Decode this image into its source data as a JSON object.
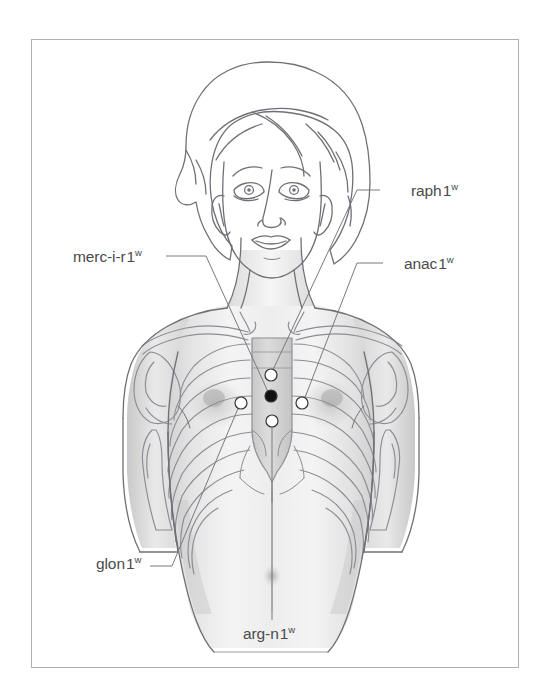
{
  "figure": {
    "kind": "anatomical-point-diagram",
    "view": "anterior",
    "width": 539,
    "height": 695,
    "border": {
      "x": 31,
      "y": 39,
      "width": 487,
      "height": 628,
      "color": "#b0b0b0"
    },
    "colors": {
      "background": "#ffffff",
      "outline": "#6f6f76",
      "bone_outline": "#8a8a92",
      "skin_shade_light": "#ececec",
      "skin_shade_mid": "#d8d8d8",
      "skin_shade_dark": "#bcbcbc",
      "label_text": "#4a4a4a",
      "leader_line": "#7a7a7a",
      "marker_fill_open": "#ffffff",
      "marker_fill_filled": "#111111",
      "marker_stroke": "#333333"
    }
  },
  "labels": [
    {
      "id": "raph",
      "name": "raph",
      "index": "1",
      "superscript": "w",
      "text": "raph 1",
      "full_text": "raph 1w",
      "side": "right",
      "text_x": 411,
      "text_y": 183,
      "marker_id": "raph-point",
      "leader": "M 380 190 L 420 190",
      "leader_path": "M 380 190 L 357 190 L 272 372"
    },
    {
      "id": "anac",
      "name": "anac",
      "index": "1",
      "superscript": "w",
      "text": "anac 1",
      "full_text": "anac 1w",
      "side": "right",
      "text_x": 404,
      "text_y": 256,
      "marker_id": "anac-point",
      "leader_path": "M 383 263 L 357 263 L 304 400"
    },
    {
      "id": "merc-i-r",
      "name": "merc-i-r",
      "index": "1",
      "superscript": "w",
      "text": "merc-i-r 1",
      "full_text": "merc-i-r 1w",
      "side": "left",
      "text_x": 73,
      "text_y": 249,
      "marker_id": "merc-point",
      "leader_path": "M 166 256 L 206 256 L 269 394"
    },
    {
      "id": "glon",
      "name": "glon",
      "index": "1",
      "superscript": "w",
      "text": "glon 1",
      "full_text": "glon 1w",
      "side": "left-lower",
      "text_x": 96,
      "text_y": 556,
      "marker_id": "glon-point",
      "leader_path": "M 150 566 L 172 566 L 239 406"
    },
    {
      "id": "arg-n",
      "name": "arg-n",
      "index": "1",
      "superscript": "w",
      "text": "arg-n 1",
      "full_text": "arg-n 1w",
      "side": "bottom-center",
      "text_x": 243,
      "text_y": 626,
      "marker_id": "argn-point",
      "leader_path": "M 272 424 L 272 620"
    }
  ],
  "markers": [
    {
      "id": "raph-point",
      "label": "raph 1",
      "cx": 271,
      "cy": 375,
      "r": 6.0,
      "style": "open"
    },
    {
      "id": "merc-point",
      "label": "merc-i-r 1",
      "cx": 271,
      "cy": 396,
      "r": 6.0,
      "style": "filled"
    },
    {
      "id": "glon-point",
      "label": "glon 1",
      "cx": 241,
      "cy": 403,
      "r": 6.0,
      "style": "open"
    },
    {
      "id": "anac-point",
      "label": "anac 1",
      "cx": 302,
      "cy": 403,
      "r": 6.0,
      "style": "open"
    },
    {
      "id": "argn-point",
      "label": "arg-n 1",
      "cx": 272,
      "cy": 421,
      "r": 6.0,
      "style": "open"
    }
  ],
  "anatomy": {
    "regions": [
      "head",
      "face",
      "hair",
      "neck",
      "shoulders",
      "clavicle-left",
      "clavicle-right",
      "scapula-left",
      "scapula-right",
      "humerus-head-left",
      "humerus-head-right",
      "sternum",
      "ribcage",
      "costal-margin",
      "breasts",
      "abdomen",
      "navel",
      "waist",
      "hips",
      "upper-arm-left",
      "upper-arm-right"
    ]
  }
}
